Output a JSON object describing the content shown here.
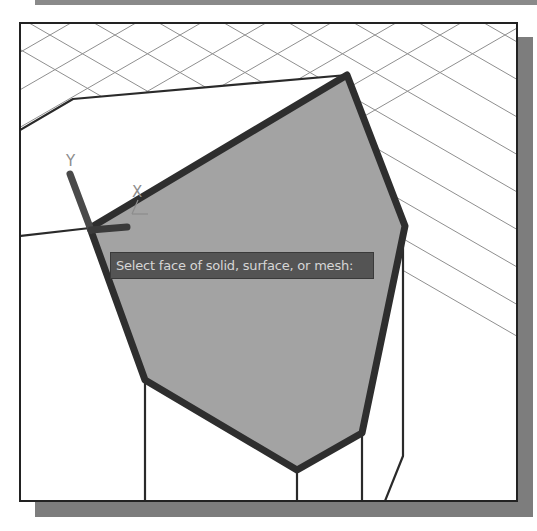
{
  "viewport": {
    "background": "#ffffff",
    "border_color": "#222222",
    "shadow_color": "#7d7d7d"
  },
  "command_prompt": {
    "text": "Select face of solid, surface, or mesh:",
    "background": "#545454",
    "text_color": "#d6d6d6"
  },
  "ucs_icon": {
    "y_label": "Y",
    "x_label": "X",
    "y_axis": [
      [
        70,
        174
      ],
      [
        91,
        230
      ]
    ],
    "x_axis": [
      [
        91,
        230
      ],
      [
        127,
        227
      ]
    ]
  },
  "selected_face": {
    "fill": "#a3a3a3",
    "outline": "#2e2e2e",
    "vertices": [
      [
        90,
        228
      ],
      [
        347,
        75
      ],
      [
        405,
        226
      ],
      [
        362,
        433
      ],
      [
        297,
        470
      ],
      [
        145,
        380
      ]
    ]
  },
  "edges": [
    [
      [
        20,
        130
      ],
      [
        73,
        99
      ],
      [
        347,
        75
      ]
    ],
    [
      [
        20,
        236
      ],
      [
        90,
        228
      ]
    ],
    [
      [
        145,
        380
      ],
      [
        145,
        501
      ]
    ],
    [
      [
        297,
        470
      ],
      [
        297,
        501
      ]
    ],
    [
      [
        362,
        433
      ],
      [
        362,
        501
      ]
    ],
    [
      [
        403,
        238
      ],
      [
        403,
        456
      ],
      [
        385,
        501
      ]
    ]
  ],
  "grid": {
    "color": "#8f8f8f",
    "slope": 0.577,
    "spacing": 130,
    "offsets": [
      -5,
      50,
      115,
      180,
      245,
      310,
      375,
      440,
      505
    ]
  }
}
